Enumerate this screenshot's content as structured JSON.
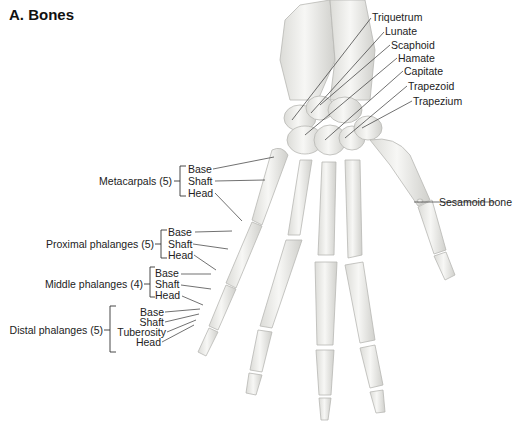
{
  "title": "A. Bones",
  "carpals": [
    "Triquetrum",
    "Lunate",
    "Scaphoid",
    "Hamate",
    "Capitate",
    "Trapezoid",
    "Trapezium"
  ],
  "sesamoid": "Sesamoid bone",
  "groups": {
    "metacarpals": {
      "label": "Metacarpals (5)",
      "parts": [
        "Base",
        "Shaft",
        "Head"
      ]
    },
    "proximal": {
      "label": "Proximal phalanges (5)",
      "parts": [
        "Base",
        "Shaft",
        "Head"
      ]
    },
    "middle": {
      "label": "Middle phalanges (4)",
      "parts": [
        "Base",
        "Shaft",
        "Head"
      ]
    },
    "distal": {
      "label": "Distal phalanges (5)",
      "parts": [
        "Base",
        "Shaft",
        "Tuberosity",
        "Head"
      ]
    }
  },
  "colors": {
    "bone_fill": "#f2f2f0",
    "bone_stroke": "#b8b8b4",
    "leader": "#333333",
    "text": "#222222"
  }
}
